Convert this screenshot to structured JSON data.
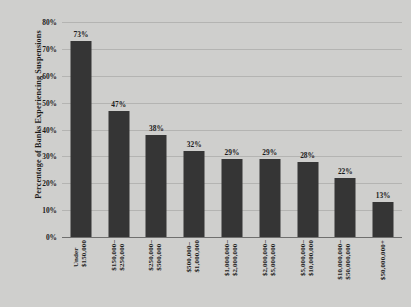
{
  "chart_data": {
    "type": "bar",
    "title": "",
    "xlabel": "",
    "ylabel": "Percentage of Banks Experiencing Suspensions",
    "ylim": [
      0,
      80
    ],
    "ytick_labels": [
      "80%",
      "70%",
      "60%",
      "50%",
      "40%",
      "30%",
      "20%",
      "10%",
      "0%"
    ],
    "ytick_values": [
      80,
      70,
      60,
      50,
      40,
      30,
      20,
      10,
      0
    ],
    "grid": true,
    "legend": "none",
    "bar_color": "#353535",
    "background_color": "#cfcfcd",
    "gridline_color": "#b4b4b2",
    "categories": [
      "Under $150,000",
      "$150,000–$250,000",
      "$250,000–$500,000",
      "$500,000–$1,000,000",
      "$1,000,000–$2,000,000",
      "$2,000,000–$5,000,000",
      "$5,000,000–$10,000,000",
      "$10,000,000–$50,000,000",
      "$50,000,000+"
    ],
    "category_lines": [
      [
        "Under",
        "$150,000"
      ],
      [
        "$150,000–",
        "$250,000"
      ],
      [
        "$250,000–",
        "$500,000"
      ],
      [
        "$500,000–",
        "$1,000,000"
      ],
      [
        "$1,000,000–",
        "$2,000,000"
      ],
      [
        "$2,000,000–",
        "$5,000,000"
      ],
      [
        "$5,000,000–",
        "$10,000,000"
      ],
      [
        "$10,000,000–",
        "$50,000,000"
      ],
      [
        "$50,000,000+"
      ]
    ],
    "values": [
      73,
      47,
      38,
      32,
      29,
      29,
      28,
      22,
      13
    ],
    "data_labels": [
      "73%",
      "47%",
      "38%",
      "32%",
      "29%",
      "29%",
      "28%",
      "22%",
      "13%"
    ]
  }
}
